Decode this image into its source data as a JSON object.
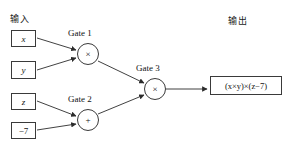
{
  "diagram": {
    "title_input": "输入",
    "title_output": "输出",
    "inputs": [
      {
        "id": "x",
        "label": "x",
        "italic": true,
        "x": 11,
        "y": 30,
        "w": 25,
        "h": 17
      },
      {
        "id": "y",
        "label": "y",
        "italic": true,
        "x": 11,
        "y": 61,
        "w": 25,
        "h": 18
      },
      {
        "id": "z",
        "label": "z",
        "italic": true,
        "x": 11,
        "y": 93,
        "w": 25,
        "h": 17
      },
      {
        "id": "c",
        "label": "−7",
        "italic": false,
        "x": 11,
        "y": 122,
        "w": 25,
        "h": 17
      }
    ],
    "gates": [
      {
        "id": "gate1",
        "name": "Gate 1",
        "op": "×",
        "cx": 88,
        "cy": 54,
        "r": 11,
        "label_x": 68,
        "label_y": 28
      },
      {
        "id": "gate2",
        "name": "Gate 2",
        "op": "+",
        "cx": 88,
        "cy": 120,
        "r": 11,
        "label_x": 68,
        "label_y": 94
      },
      {
        "id": "gate3",
        "name": "Gate 3",
        "op": "×",
        "cx": 155,
        "cy": 89,
        "r": 11,
        "label_x": 136,
        "label_y": 63
      }
    ],
    "output": {
      "expression": "(x×y)×(z−7)",
      "x": 210,
      "y": 76,
      "w": 72,
      "h": 19
    },
    "labels": {
      "input_x": 10,
      "input_y": 12,
      "output_x": 228,
      "output_y": 14
    },
    "colors": {
      "stroke": "#3a3a3a",
      "wire": "#2b2b2b",
      "text": "#111111",
      "background": "#ffffff"
    },
    "wires": [
      {
        "from": "x",
        "to": "gate1",
        "x1": 37,
        "y1": 38,
        "x2": 76,
        "y2": 50
      },
      {
        "from": "y",
        "to": "gate1",
        "x1": 37,
        "y1": 70,
        "x2": 76,
        "y2": 58
      },
      {
        "from": "z",
        "to": "gate2",
        "x1": 37,
        "y1": 101,
        "x2": 76,
        "y2": 116
      },
      {
        "from": "c",
        "to": "gate2",
        "x1": 37,
        "y1": 130,
        "x2": 76,
        "y2": 124
      },
      {
        "from": "gate1",
        "to": "gate3",
        "x1": 98,
        "y1": 61,
        "x2": 144,
        "y2": 83
      },
      {
        "from": "gate2",
        "to": "gate3",
        "x1": 98,
        "y1": 114,
        "x2": 144,
        "y2": 95
      },
      {
        "from": "gate3",
        "to": "output",
        "x1": 166,
        "y1": 89,
        "x2": 207,
        "y2": 89
      }
    ]
  }
}
